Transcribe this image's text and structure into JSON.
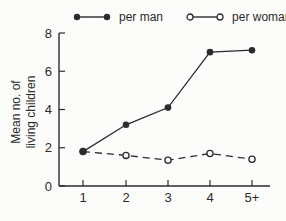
{
  "figure": {
    "background": "#fcfcfa",
    "ink_color": "#2b2b2b"
  },
  "chart_data": {
    "type": "line",
    "title": "",
    "xlabel": "",
    "ylabel_lines": [
      "Mean no. of",
      "living children"
    ],
    "categories": [
      "1",
      "2",
      "3",
      "4",
      "5+"
    ],
    "yticks": [
      "0",
      "2",
      "4",
      "6",
      "8"
    ],
    "ylim": [
      0,
      8
    ],
    "grid": "off",
    "legend_position": "top",
    "series": [
      {
        "name": "per woman",
        "values": [
          1.8,
          1.6,
          1.35,
          1.7,
          1.4
        ],
        "marker": "open-circle",
        "line": "dashed"
      },
      {
        "name": "per man",
        "values": [
          1.8,
          3.2,
          4.1,
          7.0,
          7.1
        ],
        "marker": "filled-circle",
        "line": "solid"
      }
    ]
  }
}
